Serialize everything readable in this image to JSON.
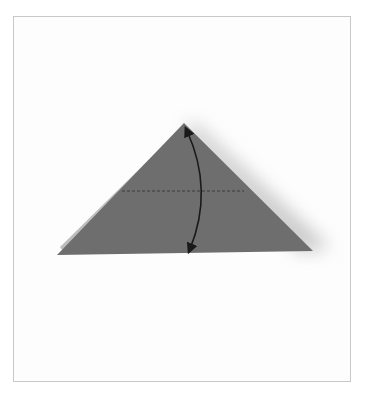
{
  "diagram": {
    "type": "origami-step",
    "colors": {
      "paper": "#6e6e6e",
      "paper_edge_light": "#bdbdbd",
      "crease_line": "#3a3a3a",
      "arrow": "#1a1a1a",
      "frame_border": "#c8c8c8",
      "background": "#ffffff"
    },
    "elements": {
      "triangle": {
        "apex": [
          184,
          123
        ],
        "left_base": [
          57,
          255
        ],
        "right_base": [
          313,
          251
        ]
      },
      "crease": {
        "style": "dashed",
        "y": 191,
        "x_start": 122,
        "x_end": 244,
        "meaning": "valley fold line"
      },
      "arrow": {
        "style": "curved double-headed",
        "from": [
          187,
          130
        ],
        "to": [
          190,
          250
        ],
        "meaning": "fold apex down to base and unfold"
      }
    }
  }
}
